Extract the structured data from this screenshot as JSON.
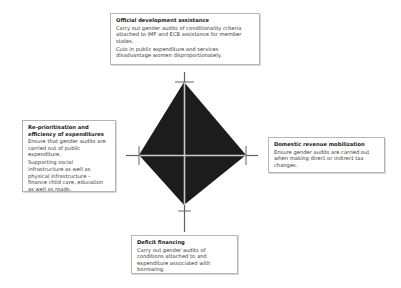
{
  "diagram": {
    "type": "diamond",
    "colors": {
      "fill": "#1c1c1c",
      "axis_lines": "#c8c8c8",
      "tick_marks": "#444444",
      "box_border": "#b5b5b5"
    },
    "boxes": {
      "top": {
        "title": "Official development assistance",
        "paragraphs": [
          "Carry out gender audits of conditionality criteria attached to IMF and ECB assistance for member states.",
          "Cuts in public expenditure and services disadvantage women disproportionately."
        ]
      },
      "left": {
        "title": "Re-prioritisation and efficiency of expenditures",
        "paragraphs": [
          "Ensure that gender audits are carried out of public expenditure.",
          "Supporting social infrastructure as well as physical infrastructure – finance child care, education as well as roads."
        ]
      },
      "right": {
        "title": "Domestic revenue mobilization",
        "paragraphs": [
          "Ensure gender audits are carried out when making direct or indirect tax changes."
        ]
      },
      "bottom": {
        "title": "Deficit financing",
        "paragraphs": [
          "Carry out gender audits of conditions attached to and expenditure associated with borrowing."
        ]
      }
    }
  }
}
